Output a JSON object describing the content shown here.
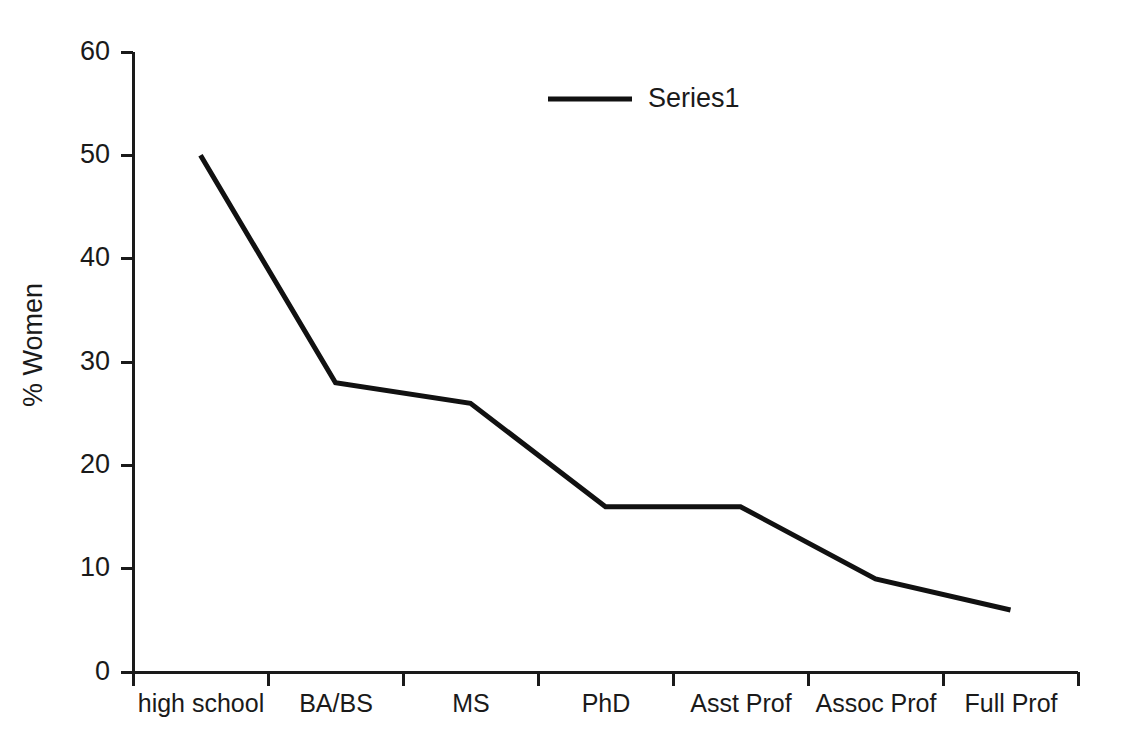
{
  "chart_data": {
    "type": "line",
    "title": "",
    "subtitle": "",
    "xlabel": "",
    "ylabel": "% Women",
    "categories": [
      "high school",
      "BA/BS",
      "MS",
      "PhD",
      "Asst Prof",
      "Assoc Prof",
      "Full Prof"
    ],
    "series": [
      {
        "name": "Series1",
        "values": [
          50,
          28,
          26,
          16,
          16,
          9,
          6
        ],
        "color": "#111111"
      }
    ],
    "ylim": [
      0,
      60
    ],
    "yticks": [
      0,
      10,
      20,
      30,
      40,
      50,
      60
    ],
    "ytick_labels": [
      "0",
      "10",
      "20",
      "30",
      "40",
      "50",
      "60"
    ],
    "grid": false,
    "legend": {
      "position": "top-center",
      "entries": [
        "Series1"
      ]
    },
    "line_color": "#111111",
    "background_color": "#ffffff",
    "axis_color": "#1a1a1a"
  },
  "axes": {
    "y_title": "% Women",
    "y_tick_0": "0",
    "y_tick_1": "10",
    "y_tick_2": "20",
    "y_tick_3": "30",
    "y_tick_4": "40",
    "y_tick_5": "50",
    "y_tick_6": "60"
  },
  "categories": {
    "c0": "high school",
    "c1": "BA/BS",
    "c2": "MS",
    "c3": "PhD",
    "c4": "Asst Prof",
    "c5": "Assoc Prof",
    "c6": "Full Prof"
  },
  "legend": {
    "series1_label": "Series1"
  }
}
